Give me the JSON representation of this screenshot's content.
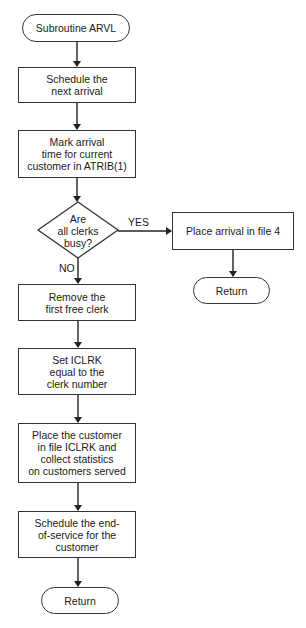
{
  "flowchart": {
    "start": {
      "label": "Subroutine ARVL"
    },
    "steps": [
      {
        "label": "Schedule the\nnext arrival"
      },
      {
        "label": "Mark arrival\ntime for current\ncustomer in  ATRIB(1)"
      }
    ],
    "decision": {
      "label": "Are\nall clerks\nbusy?",
      "yes_label": "YES",
      "no_label": "NO"
    },
    "yes_branch": {
      "step": {
        "label": "Place arrival  in file 4"
      },
      "end": {
        "label": "Return"
      }
    },
    "no_branch": {
      "steps": [
        {
          "label": "Remove the\nfirst free clerk"
        },
        {
          "label": "Set ICLRK\nequal to the\nclerk number"
        },
        {
          "label": "Place the customer\nin file ICLRK and\ncollect statistics\non customers served"
        },
        {
          "label": "Schedule the end-\nof-service for the\ncustomer"
        }
      ],
      "end": {
        "label": "Return"
      }
    }
  }
}
